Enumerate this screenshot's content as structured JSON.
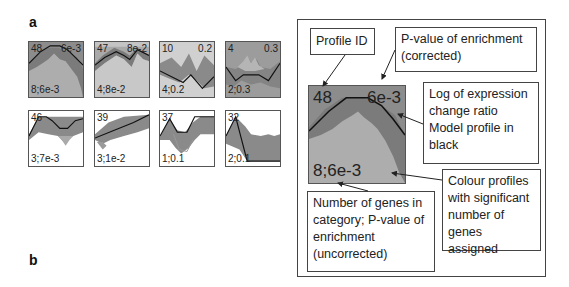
{
  "panels": {
    "a": {
      "label": "a"
    },
    "b": {
      "label": "b"
    }
  },
  "colors": {
    "significant_fill": "#8a8a8a",
    "significant_bg": "#a8a8a8",
    "light_bg": "#cfcfcf",
    "white_bg": "#ffffff",
    "gene_band": "#7c7c7c",
    "model_line": "#111111"
  },
  "profiles": [
    {
      "id": "48",
      "p_corrected": "6e-3",
      "count_p": "8;6e-3",
      "significant": true
    },
    {
      "id": "47",
      "p_corrected": "8e-2",
      "count_p": "4;8e-2",
      "significant": true
    },
    {
      "id": "10",
      "p_corrected": "0.2",
      "count_p": "4;0.2",
      "significant": false
    },
    {
      "id": "4",
      "p_corrected": "0.3",
      "count_p": "2;0.3",
      "significant": true
    },
    {
      "id": "46",
      "p_corrected": "",
      "count_p": "3;7e-3",
      "significant": false
    },
    {
      "id": "39",
      "p_corrected": "",
      "count_p": "3;1e-2",
      "significant": false
    },
    {
      "id": "37",
      "p_corrected": "",
      "count_p": "1;0.1",
      "significant": false
    },
    {
      "id": "32",
      "p_corrected": "",
      "count_p": "2;0.1",
      "significant": false
    }
  ],
  "legend": {
    "example": {
      "id": "48",
      "p_corrected": "6e-3",
      "count_p": "8;6e-3"
    },
    "callouts": {
      "profile_id": "Profile ID",
      "p_corrected": "P-value of enrichment (corrected)",
      "log_ratio": "Log of expression change ratio Model profile in black",
      "colour_profiles": "Colour profiles with significant number of genes assigned",
      "count_p_uncorrected": "Number of genes in category; P-value of enrichment (uncorrected)"
    }
  }
}
